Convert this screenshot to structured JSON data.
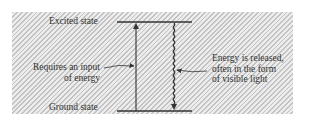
{
  "diagram": {
    "type": "energy-level-diagram",
    "levels": [
      {
        "id": "excited",
        "label": "Excited state"
      },
      {
        "id": "ground",
        "label": "Ground state"
      }
    ],
    "transitions": [
      {
        "from": "ground",
        "to": "excited",
        "style": "solid",
        "annotation": [
          "Requires an input",
          "of energy"
        ]
      },
      {
        "from": "excited",
        "to": "ground",
        "style": "wavy",
        "annotation": [
          "Energy is released,",
          "often in the form",
          "of visible light"
        ]
      }
    ]
  },
  "labels": {
    "excited_state": "Excited state",
    "ground_state": "Ground state",
    "absorption_line1": "Requires an input",
    "absorption_line2": "of energy",
    "emission_line1": "Energy is released,",
    "emission_line2": "often in the form",
    "emission_line3": "of visible light"
  },
  "colors": {
    "line": "#333333",
    "text": "#333333",
    "hatch_dark": "#c2c2c2",
    "hatch_light": "#ececec"
  }
}
